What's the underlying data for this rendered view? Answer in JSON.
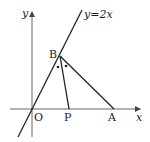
{
  "diagram": {
    "axes": {
      "x_label": "x",
      "y_label": "y",
      "origin_label": "O"
    },
    "line": {
      "equation_label": "y=2x"
    },
    "points": {
      "B": "B",
      "P": "P",
      "A": "A"
    },
    "segments": [
      "OB",
      "BP",
      "BA",
      "OA"
    ],
    "angle_marks": {
      "description": "Equal angles OBP and PBA marked with dots",
      "count": 2
    },
    "colors": {
      "stroke": "#222222",
      "axis": "#555555",
      "background": "#ffffff"
    }
  }
}
